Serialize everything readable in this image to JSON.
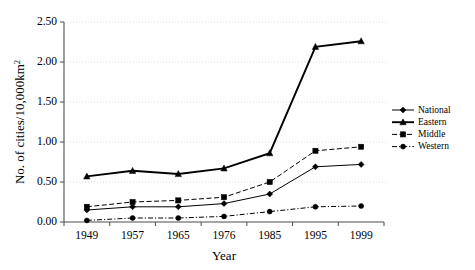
{
  "chart_data": {
    "type": "line",
    "title": "",
    "xlabel": "Year",
    "ylabel": "No. of cities/10,000km2",
    "ylabel_display": "No. of cities/10,000km",
    "ylabel_superscript": "2",
    "categories": [
      "1949",
      "1957",
      "1965",
      "1976",
      "1985",
      "1995",
      "1999"
    ],
    "ylim": [
      0.0,
      2.5
    ],
    "ytick_labels": [
      "0.00",
      "0.50",
      "1.00",
      "1.50",
      "2.00",
      "2.50"
    ],
    "ytick_values": [
      0.0,
      0.5,
      1.0,
      1.5,
      2.0,
      2.5
    ],
    "grid": true,
    "legend_position": "right",
    "series": [
      {
        "name": "National",
        "marker": "diamond",
        "dash": "solid",
        "color": "#000000",
        "values": [
          0.15,
          0.19,
          0.19,
          0.23,
          0.35,
          0.69,
          0.72
        ]
      },
      {
        "name": "Eastern",
        "marker": "triangle",
        "dash": "solid-bold",
        "color": "#000000",
        "values": [
          0.57,
          0.64,
          0.6,
          0.67,
          0.86,
          2.19,
          2.26
        ]
      },
      {
        "name": "Middle",
        "marker": "square",
        "dash": "dashed",
        "color": "#000000",
        "values": [
          0.19,
          0.25,
          0.27,
          0.31,
          0.5,
          0.89,
          0.94
        ]
      },
      {
        "name": "Western",
        "marker": "circle",
        "dash": "dashdot",
        "color": "#000000",
        "values": [
          0.02,
          0.05,
          0.05,
          0.07,
          0.13,
          0.19,
          0.2
        ]
      }
    ]
  }
}
